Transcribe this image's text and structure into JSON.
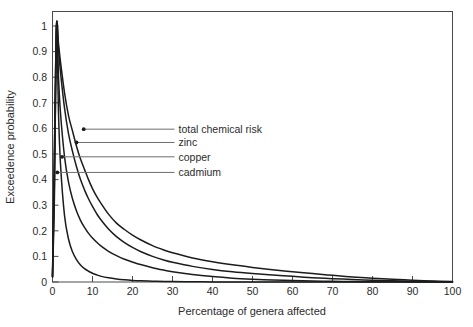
{
  "chart_data": {
    "type": "line",
    "title": "",
    "xlabel": "Percentage of genera affected",
    "ylabel": "Exceedence probability",
    "xlim": [
      0,
      100
    ],
    "ylim": [
      0,
      1
    ],
    "grid": false,
    "legend_position": "inline-leader-lines",
    "xticks": [
      "0",
      "10",
      "20",
      "30",
      "40",
      "50",
      "60",
      "70",
      "80",
      "90",
      "100"
    ],
    "xtick_values": [
      0,
      10,
      20,
      30,
      40,
      50,
      60,
      70,
      80,
      90,
      100
    ],
    "yticks": [
      "0",
      "0.1",
      "0.2",
      "0.3",
      "0.4",
      "0.5",
      "0.6",
      "0.7",
      "0.8",
      "0.9",
      "1"
    ],
    "ytick_values": [
      0,
      0.1,
      0.2,
      0.3,
      0.4,
      0.5,
      0.6,
      0.7,
      0.8,
      0.9,
      1
    ],
    "x": [
      0,
      0.5,
      1,
      1.5,
      2,
      3,
      4,
      5,
      6,
      7,
      8,
      9,
      10,
      11,
      12,
      14,
      16,
      18,
      20,
      22,
      25,
      28,
      30,
      35,
      40,
      45,
      50,
      55,
      60,
      65,
      70,
      75,
      80,
      85,
      90,
      95,
      100
    ],
    "series": [
      {
        "name": "total chemical risk",
        "color": "#1c1c1c",
        "values": [
          0.02,
          0.55,
          1.0,
          0.93,
          0.86,
          0.74,
          0.65,
          0.59,
          0.53,
          0.48,
          0.44,
          0.4,
          0.365,
          0.335,
          0.31,
          0.265,
          0.23,
          0.205,
          0.183,
          0.165,
          0.142,
          0.124,
          0.114,
          0.094,
          0.079,
          0.067,
          0.057,
          0.048,
          0.04,
          0.033,
          0.026,
          0.02,
          0.015,
          0.011,
          0.007,
          0.004,
          0.002
        ],
        "anchor": {
          "x": 7.8,
          "y": 0.597
        }
      },
      {
        "name": "zinc",
        "color": "#1c1c1c",
        "values": [
          0.02,
          0.52,
          1.0,
          0.91,
          0.82,
          0.68,
          0.58,
          0.51,
          0.45,
          0.4,
          0.36,
          0.325,
          0.295,
          0.268,
          0.245,
          0.207,
          0.177,
          0.154,
          0.135,
          0.119,
          0.1,
          0.085,
          0.077,
          0.061,
          0.049,
          0.04,
          0.033,
          0.027,
          0.022,
          0.017,
          0.013,
          0.01,
          0.007,
          0.005,
          0.003,
          0.0015,
          0.0005
        ],
        "anchor": {
          "x": 6.0,
          "y": 0.545
        }
      },
      {
        "name": "copper",
        "color": "#1c1c1c",
        "values": [
          0.02,
          0.4,
          1.0,
          0.8,
          0.66,
          0.49,
          0.39,
          0.325,
          0.277,
          0.241,
          0.213,
          0.19,
          0.172,
          0.156,
          0.142,
          0.12,
          0.103,
          0.089,
          0.078,
          0.068,
          0.056,
          0.046,
          0.04,
          0.029,
          0.021,
          0.015,
          0.011,
          0.008,
          0.0055,
          0.0038,
          0.0026,
          0.0017,
          0.0011,
          0.0007,
          0.0004,
          0.0002,
          0.0001
        ],
        "anchor": {
          "x": 2.4,
          "y": 0.489
        }
      },
      {
        "name": "cadmium",
        "color": "#1c1c1c",
        "values": [
          0.02,
          0.35,
          1.0,
          0.66,
          0.46,
          0.26,
          0.168,
          0.118,
          0.087,
          0.066,
          0.052,
          0.042,
          0.034,
          0.028,
          0.023,
          0.0162,
          0.0116,
          0.0085,
          0.0063,
          0.0047,
          0.003,
          0.002,
          0.0015,
          0.0008,
          0.0004,
          0.0002,
          0.0001,
          5e-05,
          3e-05,
          2e-05,
          1e-05,
          5e-06,
          3e-06,
          2e-06,
          1e-06,
          5e-07,
          2e-07
        ],
        "anchor": {
          "x": 1.2,
          "y": 0.428
        }
      }
    ],
    "annotations": [
      {
        "label": "total chemical risk",
        "leader_to_x": 30.5,
        "leader_y": 0.597
      },
      {
        "label": "zinc",
        "leader_to_x": 30.5,
        "leader_y": 0.545
      },
      {
        "label": "copper",
        "leader_to_x": 30.5,
        "leader_y": 0.489
      },
      {
        "label": "cadmium",
        "leader_to_x": 30.5,
        "leader_y": 0.428
      }
    ]
  }
}
